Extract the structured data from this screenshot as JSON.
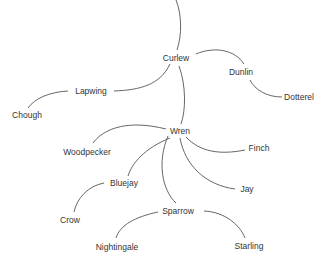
{
  "diagram": {
    "type": "tree",
    "line_color": "#555555",
    "text_color": "#333333",
    "background": "#ffffff",
    "nodes": [
      {
        "id": "curlew",
        "label": "Curlew",
        "x": 176,
        "y": 58
      },
      {
        "id": "dunlin",
        "label": "Dunlin",
        "x": 241,
        "y": 72
      },
      {
        "id": "dotterel",
        "label": "Dotterel",
        "x": 299,
        "y": 97
      },
      {
        "id": "lapwing",
        "label": "Lapwing",
        "x": 91,
        "y": 91
      },
      {
        "id": "chough",
        "label": "Chough",
        "x": 27,
        "y": 115
      },
      {
        "id": "wren",
        "label": "Wren",
        "x": 180,
        "y": 131
      },
      {
        "id": "woodpecker",
        "label": "Woodpecker",
        "x": 87,
        "y": 152
      },
      {
        "id": "finch",
        "label": "Finch",
        "x": 259,
        "y": 148
      },
      {
        "id": "bluejay",
        "label": "Bluejay",
        "x": 124,
        "y": 183
      },
      {
        "id": "jay",
        "label": "Jay",
        "x": 247,
        "y": 189
      },
      {
        "id": "crow",
        "label": "Crow",
        "x": 70,
        "y": 220
      },
      {
        "id": "sparrow",
        "label": "Sparrow",
        "x": 178,
        "y": 211
      },
      {
        "id": "nightingale",
        "label": "Nightingale",
        "x": 117,
        "y": 247
      },
      {
        "id": "starling",
        "label": "Starling",
        "x": 249,
        "y": 246
      }
    ],
    "edges": [
      {
        "from": "root",
        "to": "curlew",
        "d": "M176,0 C182,15 182,35 177,50"
      },
      {
        "from": "curlew",
        "to": "dunlin",
        "d": "M196,54 C215,46 235,50 244,64"
      },
      {
        "from": "dunlin",
        "to": "dotterel",
        "d": "M250,80 C255,90 267,97 282,97"
      },
      {
        "from": "curlew",
        "to": "lapwing",
        "d": "M170,64 C160,85 140,90 114,91"
      },
      {
        "from": "lapwing",
        "to": "chough",
        "d": "M68,91 C50,92 35,98 28,108"
      },
      {
        "from": "curlew",
        "to": "wren",
        "d": "M179,66 C186,85 186,110 181,124"
      },
      {
        "from": "wren",
        "to": "woodpecker",
        "d": "M166,129 C130,120 105,127 93,143"
      },
      {
        "from": "wren",
        "to": "finch",
        "d": "M186,137 C200,152 220,155 245,150"
      },
      {
        "from": "wren",
        "to": "bluejay",
        "d": "M170,138 C145,148 132,163 128,176"
      },
      {
        "from": "wren",
        "to": "jay",
        "d": "M180,138 C185,165 205,185 235,189"
      },
      {
        "from": "wren",
        "to": "sparrow",
        "d": "M168,136 C157,162 162,190 176,203"
      },
      {
        "from": "bluejay",
        "to": "crow",
        "d": "M104,183 C88,186 77,198 74,212"
      },
      {
        "from": "sparrow",
        "to": "nightingale",
        "d": "M158,212 C135,217 120,225 116,238"
      },
      {
        "from": "sparrow",
        "to": "starling",
        "d": "M204,211 C225,212 240,225 245,238"
      }
    ]
  }
}
